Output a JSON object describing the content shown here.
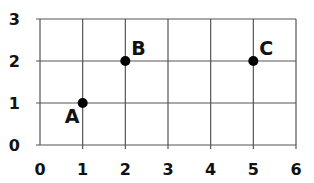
{
  "chart_data": {
    "type": "scatter",
    "title": "",
    "xlabel": "",
    "ylabel": "",
    "xlim": [
      0,
      6
    ],
    "ylim": [
      0,
      3
    ],
    "grid": true,
    "legend": null,
    "x_ticks": [
      "0",
      "1",
      "2",
      "3",
      "4",
      "5",
      "6"
    ],
    "y_ticks": [
      "0",
      "1",
      "2",
      "3"
    ],
    "points": [
      {
        "label": "A",
        "x": 1,
        "y": 1
      },
      {
        "label": "B",
        "x": 2,
        "y": 2
      },
      {
        "label": "C",
        "x": 5,
        "y": 2
      }
    ]
  },
  "colors": {
    "grid": "#555555",
    "points": "#000000",
    "text": "#111111"
  }
}
